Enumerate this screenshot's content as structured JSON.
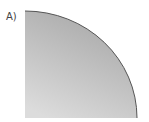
{
  "figure": {
    "label": "A)",
    "shape": "quarter-circle",
    "colors": {
      "fill_top": "#a9a9a9",
      "fill_bottom": "#dedede",
      "stroke": "#555555"
    }
  }
}
